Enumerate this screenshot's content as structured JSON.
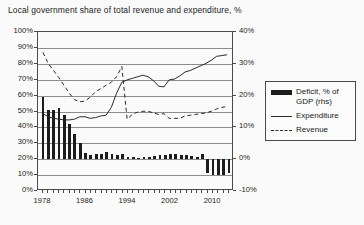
{
  "title": "Local government share of total revenue and expenditure, %",
  "legend": {
    "items": [
      {
        "label": "Deficit, % of GDP (rhs)",
        "key": "bar-swatch",
        "color": "#1c1c1c"
      },
      {
        "label": "Expenditure",
        "key": "solid-line-swatch",
        "color": "#2a2a2a"
      },
      {
        "label": "Revenue",
        "key": "dashed-line-swatch",
        "color": "#2a2a2a"
      }
    ]
  },
  "axes": {
    "left_ticks": [
      "100%",
      "90%",
      "80%",
      "70%",
      "60%",
      "50%",
      "40%",
      "30%",
      "20%",
      "10%",
      "0%"
    ],
    "right_ticks": [
      "40%",
      "30%",
      "20%",
      "10%",
      "0%",
      "-10%"
    ],
    "x_ticks": [
      "1978",
      "1986",
      "1994",
      "2002",
      "2010"
    ]
  },
  "chart_data": {
    "type": "line",
    "title": "Local government share of total revenue and expenditure, %",
    "xlabel": "",
    "ylabel": "",
    "ylim": [
      0,
      100
    ],
    "y2lim": [
      -10,
      40
    ],
    "grid": true,
    "legend_position": "right",
    "x": [
      1978,
      1979,
      1980,
      1981,
      1982,
      1983,
      1984,
      1985,
      1986,
      1987,
      1988,
      1989,
      1990,
      1991,
      1992,
      1993,
      1994,
      1995,
      1996,
      1997,
      1998,
      1999,
      2000,
      2001,
      2002,
      2003,
      2004,
      2005,
      2006,
      2007,
      2008,
      2009,
      2010,
      2011,
      2012,
      2013
    ],
    "series": [
      {
        "name": "Expenditure",
        "axis": "left",
        "style": "solid",
        "values": [
          48,
          46,
          45,
          44.5,
          44,
          44,
          44.5,
          46,
          46,
          45,
          45.5,
          46.5,
          47,
          52,
          61,
          68,
          69.5,
          70.5,
          71.5,
          72.5,
          71.5,
          69,
          65.5,
          65,
          69.5,
          70,
          72,
          74.5,
          75.5,
          77,
          78.5,
          80,
          82,
          84.5,
          85,
          85.5
        ]
      },
      {
        "name": "Revenue",
        "axis": "left",
        "style": "dashed",
        "values": [
          87,
          80,
          75.5,
          71,
          66,
          61,
          57,
          55.5,
          56,
          58.5,
          62,
          64,
          66,
          68,
          71.5,
          78,
          44.5,
          47.5,
          49,
          49.5,
          49.5,
          48.5,
          47.5,
          48,
          45,
          45,
          45,
          46.5,
          47,
          47.5,
          48,
          48.5,
          49.5,
          51,
          52,
          52.5
        ]
      },
      {
        "name": "Deficit, % of GDP (rhs)",
        "axis": "right",
        "style": "bar",
        "values": [
          19.5,
          15.5,
          15.5,
          16,
          14,
          11,
          8,
          5,
          2,
          1.2,
          1.5,
          1.8,
          2.2,
          1.5,
          1.2,
          1.5,
          0.8,
          0.6,
          0.5,
          0.6,
          0.8,
          1,
          1.2,
          1.4,
          1.6,
          1.5,
          1.3,
          1.2,
          1,
          0.8,
          1.5,
          -4.5,
          -5,
          -5,
          -5,
          -4.5
        ]
      }
    ]
  }
}
